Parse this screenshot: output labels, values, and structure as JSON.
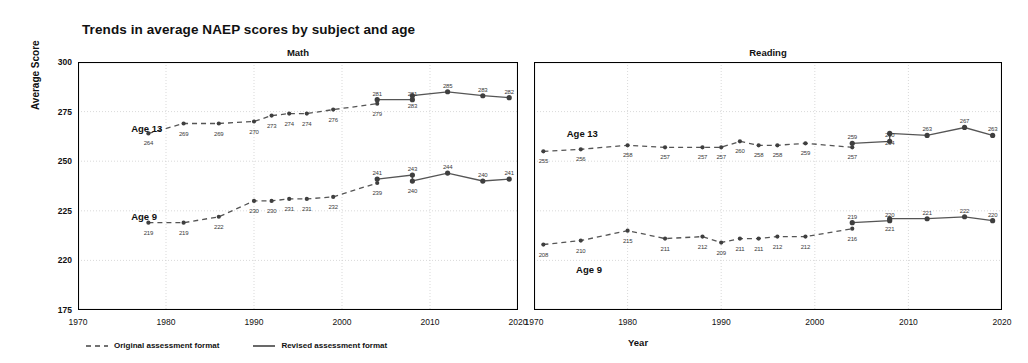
{
  "title": "Trends in average NAEP scores by subject and age",
  "axis": {
    "ylabel": "Average Score",
    "xlabel": "Year",
    "yticks": [
      "300",
      "275",
      "250",
      "225",
      "220",
      "175"
    ],
    "xticks": [
      "1970",
      "1980",
      "1990",
      "2000",
      "2010",
      "2020"
    ]
  },
  "legend": {
    "original": "Original assessment format",
    "revised": "Revised assessment format"
  },
  "labels": {
    "age13": "Age 13",
    "age9": "Age 9"
  },
  "colors": {
    "line": "#555555",
    "marker": "#3f3f3f",
    "axis": "#000000",
    "grid": "#cfcfcf",
    "text": "#111111"
  },
  "chart_data": {
    "type": "line",
    "title": "Trends in average NAEP scores by subject and age",
    "xlabel": "Year",
    "ylabel": "Average Score",
    "xlim": [
      1970,
      2020
    ],
    "ylim": [
      175,
      300
    ],
    "ytick_values": [
      300,
      275,
      250,
      225,
      220,
      175
    ],
    "grid": true,
    "legend_position": "bottom-left",
    "panels": [
      {
        "name": "Math",
        "series": [
          {
            "name": "Age 13 - Original assessment format",
            "format": "original",
            "age": 13,
            "style": "dashed",
            "x": [
              1978,
              1982,
              1986,
              1990,
              1992,
              1994,
              1996,
              1999,
              2004
            ],
            "values": [
              264,
              269,
              269,
              270,
              273,
              274,
              274,
              276,
              279
            ]
          },
          {
            "name": "Age 13 - Revised assessment format",
            "format": "revised",
            "age": 13,
            "style": "solid",
            "x": [
              2004,
              2008,
              2008,
              2012,
              2016,
              2019
            ],
            "values": [
              281,
              281,
              283,
              285,
              283,
              282
            ]
          },
          {
            "name": "Age 9 - Original assessment format",
            "format": "original",
            "age": 9,
            "style": "dashed",
            "x": [
              1978,
              1982,
              1986,
              1990,
              1992,
              1994,
              1996,
              1999,
              2004
            ],
            "values": [
              219,
              219,
              222,
              230,
              230,
              231,
              231,
              232,
              239
            ]
          },
          {
            "name": "Age 9 - Revised assessment format",
            "format": "revised",
            "age": 9,
            "style": "solid",
            "x": [
              2004,
              2008,
              2008,
              2012,
              2016,
              2019
            ],
            "values": [
              241,
              243,
              240,
              244,
              240,
              241
            ]
          }
        ]
      },
      {
        "name": "Reading",
        "series": [
          {
            "name": "Age 13 - Original assessment format",
            "format": "original",
            "age": 13,
            "style": "dashed",
            "x": [
              1971,
              1975,
              1980,
              1984,
              1988,
              1990,
              1992,
              1994,
              1996,
              1999,
              2004
            ],
            "values": [
              255,
              256,
              258,
              257,
              257,
              257,
              260,
              258,
              258,
              259,
              257
            ]
          },
          {
            "name": "Age 13 - Revised assessment format",
            "format": "revised",
            "age": 13,
            "style": "solid",
            "x": [
              2004,
              2008,
              2008,
              2012,
              2016,
              2019
            ],
            "values": [
              259,
              260,
              264,
              263,
              267,
              263
            ]
          },
          {
            "name": "Age 9 - Original assessment format",
            "format": "original",
            "age": 9,
            "style": "dashed",
            "x": [
              1971,
              1975,
              1980,
              1984,
              1988,
              1990,
              1992,
              1994,
              1996,
              1999,
              2004
            ],
            "values": [
              208,
              210,
              215,
              211,
              212,
              209,
              211,
              211,
              212,
              212,
              216
            ]
          },
          {
            "name": "Age 9 - Revised assessment format",
            "format": "revised",
            "age": 9,
            "style": "solid",
            "x": [
              2004,
              2008,
              2008,
              2012,
              2016,
              2019
            ],
            "values": [
              219,
              220,
              221,
              221,
              222,
              220
            ]
          }
        ]
      }
    ]
  }
}
